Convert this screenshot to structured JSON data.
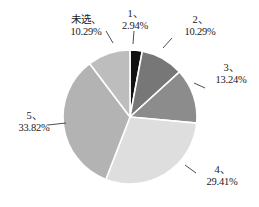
{
  "chart_data": {
    "type": "pie",
    "title": "",
    "subtitle": "",
    "xlabel": "",
    "ylabel": "",
    "legend_position": "none",
    "grid": false,
    "labels_show_percent": true,
    "categories": [
      "1",
      "2",
      "3",
      "4",
      "5",
      "未选"
    ],
    "values": [
      2.94,
      10.29,
      13.24,
      29.41,
      33.82,
      10.29
    ],
    "slices": [
      {
        "name": "1",
        "percent_text": "2.94%",
        "value": 2.94,
        "color": "#111111",
        "start_angle_deg": 0,
        "sweep_deg": 10.58,
        "label_text": "1、"
      },
      {
        "name": "2",
        "percent_text": "10.29%",
        "value": 10.29,
        "color": "#777777",
        "start_angle_deg": 10.58,
        "sweep_deg": 37.04,
        "label_text": "2、"
      },
      {
        "name": "3",
        "percent_text": "13.24%",
        "value": 13.24,
        "color": "#8c8c8c",
        "start_angle_deg": 47.62,
        "sweep_deg": 47.66,
        "label_text": "3、"
      },
      {
        "name": "4",
        "percent_text": "29.41%",
        "value": 29.41,
        "color": "#dedede",
        "start_angle_deg": 95.28,
        "sweep_deg": 105.88,
        "label_text": "4、"
      },
      {
        "name": "5",
        "percent_text": "33.82%",
        "value": 33.82,
        "color": "#b3b3b3",
        "start_angle_deg": 201.16,
        "sweep_deg": 121.75,
        "label_text": "5、"
      },
      {
        "name": "未选",
        "percent_text": "10.29%",
        "value": 10.29,
        "color": "#bdbdbd",
        "start_angle_deg": 322.91,
        "sweep_deg": 37.04,
        "label_text": "未选、"
      }
    ],
    "geometry": {
      "center_x": 130,
      "center_y": 117,
      "radius": 67,
      "separator_color": "#ffffff",
      "separator_width": 1.6,
      "background": "#ffffff"
    }
  },
  "labels": {
    "weixuan": {
      "name": "未选、",
      "percent": "10.29%"
    },
    "one": {
      "name": "1、",
      "percent": "2.94%"
    },
    "two": {
      "name": "2、",
      "percent": "10.29%"
    },
    "three": {
      "name": "3、",
      "percent": "13.24%"
    },
    "four": {
      "name": "4、",
      "percent": "29.41%"
    },
    "five": {
      "name": "5、",
      "percent": "33.82%"
    }
  }
}
